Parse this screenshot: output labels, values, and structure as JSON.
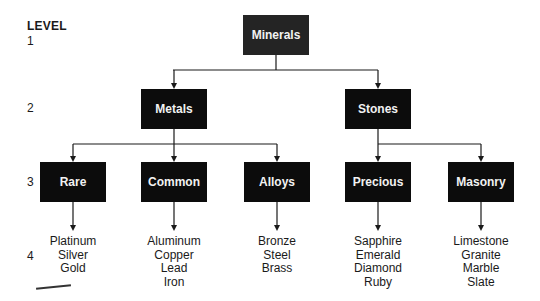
{
  "diagram": {
    "type": "hierarchy-tree",
    "level_header": "LEVEL",
    "levels": [
      "1",
      "2",
      "3",
      "4"
    ],
    "root": {
      "label": "Minerals"
    },
    "level2": [
      {
        "label": "Metals"
      },
      {
        "label": "Stones"
      }
    ],
    "level3": [
      {
        "label": "Rare",
        "parent": "Metals"
      },
      {
        "label": "Common",
        "parent": "Metals"
      },
      {
        "label": "Alloys",
        "parent": "Metals"
      },
      {
        "label": "Precious",
        "parent": "Stones"
      },
      {
        "label": "Masonry",
        "parent": "Stones"
      }
    ],
    "level4": [
      {
        "parent": "Rare",
        "items": [
          "Platinum",
          "Silver",
          "Gold"
        ]
      },
      {
        "parent": "Common",
        "items": [
          "Aluminum",
          "Copper",
          "Lead",
          "Iron"
        ]
      },
      {
        "parent": "Alloys",
        "items": [
          "Bronze",
          "Steel",
          "Brass"
        ]
      },
      {
        "parent": "Precious",
        "items": [
          "Sapphire",
          "Emerald",
          "Diamond",
          "Ruby"
        ]
      },
      {
        "parent": "Masonry",
        "items": [
          "Limestone",
          "Granite",
          "Marble",
          "Slate"
        ]
      }
    ],
    "colors": {
      "box_fill": "#0c0c0c",
      "root_fill": "#242424",
      "box_text": "#f2f2f2",
      "line": "#1a1a1a"
    }
  }
}
